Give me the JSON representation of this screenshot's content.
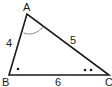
{
  "diagram": {
    "type": "triangle",
    "vertices": [
      {
        "label": "A",
        "x": 27,
        "y": 14
      },
      {
        "label": "B",
        "x": 9,
        "y": 75
      },
      {
        "label": "C",
        "x": 109,
        "y": 75
      }
    ],
    "sides": [
      {
        "between": "AB",
        "label": "4"
      },
      {
        "between": "AC",
        "label": "5"
      },
      {
        "between": "BC",
        "label": "6"
      }
    ],
    "angle_marks": [
      {
        "vertex": "A",
        "mark": "arc"
      },
      {
        "vertex": "B",
        "mark": "single-dot"
      },
      {
        "vertex": "C",
        "mark": "double-dot"
      }
    ],
    "colors": {
      "stroke": "#1a1a1a",
      "arc": "#888888",
      "background": "#ffffff"
    }
  }
}
